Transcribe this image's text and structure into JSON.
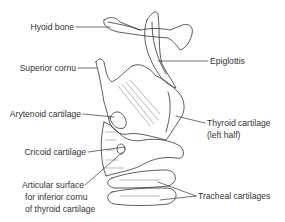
{
  "diagram": {
    "labels": {
      "hyoid_bone": "Hyoid bone",
      "superior_cornu": "Superior cornu",
      "epiglottis": "Epiglottis",
      "arytenoid_cartilage": "Arytenoid cartilage",
      "thyroid_cartilage_line1": "Thyroid cartilage",
      "thyroid_cartilage_line2": "(left half)",
      "cricoid_cartilage": "Cricoid cartilage",
      "articular_surface_line1": "Articular surface",
      "articular_surface_line2": "for inferior cornu",
      "articular_surface_line3": "of thyroid cartilage",
      "tracheal_cartilages": "Tracheal cartilages"
    },
    "colors": {
      "line": "#333333",
      "background": "#ffffff"
    }
  }
}
